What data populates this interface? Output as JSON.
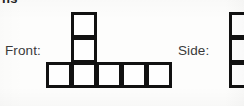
{
  "page": {
    "background_color": "#fdfdfc",
    "stroke_color": "#111111",
    "text_color": "#3a3a3a",
    "width": 244,
    "height": 106
  },
  "clipped_heading": {
    "text": "ns",
    "note": "partially cut off at top edge of crop"
  },
  "views": [
    {
      "id": "front",
      "label": "Front:",
      "label_position": {
        "x": 5,
        "y": 43
      },
      "cell_size": 26,
      "origin": {
        "x": 46,
        "y": 62
      },
      "cells": [
        {
          "col": 0,
          "row": 0
        },
        {
          "col": 1,
          "row": 0
        },
        {
          "col": 2,
          "row": 0
        },
        {
          "col": 3,
          "row": 0
        },
        {
          "col": 4,
          "row": 0
        },
        {
          "col": 1,
          "row": -1
        },
        {
          "col": 1,
          "row": -2
        }
      ],
      "description": "row of five squares with a column of two squares stacked above the second square"
    },
    {
      "id": "side",
      "label": "Side:",
      "label_position": {
        "x": 178,
        "y": 43
      },
      "cell_size": 26,
      "origin": {
        "x": 229,
        "y": 12
      },
      "clipped_right": true,
      "cells": [
        {
          "col": 0,
          "row": 0
        },
        {
          "col": 0,
          "row": 1
        },
        {
          "col": 0,
          "row": 2
        }
      ],
      "description": "vertical column of three squares, cut off by the right edge of the image"
    }
  ]
}
